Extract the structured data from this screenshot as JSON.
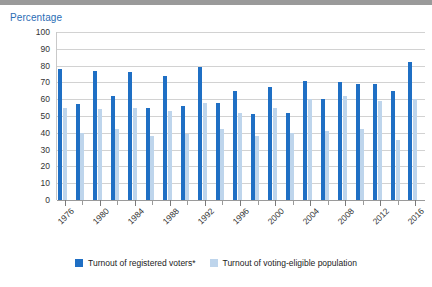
{
  "chart_data": {
    "type": "bar",
    "title": "",
    "ylabel": "Percentage",
    "xlabel": "",
    "ylim": [
      0,
      100
    ],
    "yticks": [
      0,
      10,
      20,
      30,
      40,
      50,
      60,
      70,
      80,
      90,
      100
    ],
    "grid": true,
    "legend_position": "bottom",
    "categories": [
      "1976",
      "1978",
      "1980",
      "1982",
      "1984",
      "1986",
      "1988",
      "1990",
      "1992",
      "1994",
      "1996",
      "1998",
      "2000",
      "2002",
      "2004",
      "2006",
      "2008",
      "2010",
      "2012",
      "2014",
      "2016"
    ],
    "tick_labels": [
      "1976",
      "",
      "1980",
      "",
      "1984",
      "",
      "1988",
      "",
      "1992",
      "",
      "1996",
      "",
      "2000",
      "",
      "2004",
      "",
      "2008",
      "",
      "2012",
      "",
      "2016"
    ],
    "series": [
      {
        "name": "Turnout of registered voters*",
        "color": "#1f6fc4",
        "values": [
          78,
          57,
          77,
          62,
          76,
          55,
          74,
          56,
          79,
          58,
          65,
          51,
          67,
          52,
          71,
          60,
          70,
          69,
          69,
          65,
          82
        ]
      },
      {
        "name": "Turnout of voting-eligible population",
        "color": "#bed5ec",
        "values": [
          55,
          40,
          54,
          42,
          55,
          38,
          53,
          39,
          58,
          42,
          52,
          38,
          55,
          40,
          60,
          41,
          62,
          42,
          59,
          36,
          60
        ]
      }
    ]
  },
  "legend": {
    "items": [
      {
        "label": "Turnout of registered voters*",
        "color": "#1f6fc4"
      },
      {
        "label": "Turnout of voting-eligible population",
        "color": "#bed5ec"
      }
    ]
  },
  "colors": {
    "registered": "#1f6fc4",
    "eligible": "#bed5ec",
    "title": "#2a6db5",
    "grid": "#d2d2d2",
    "axis": "#9a9a9a"
  }
}
